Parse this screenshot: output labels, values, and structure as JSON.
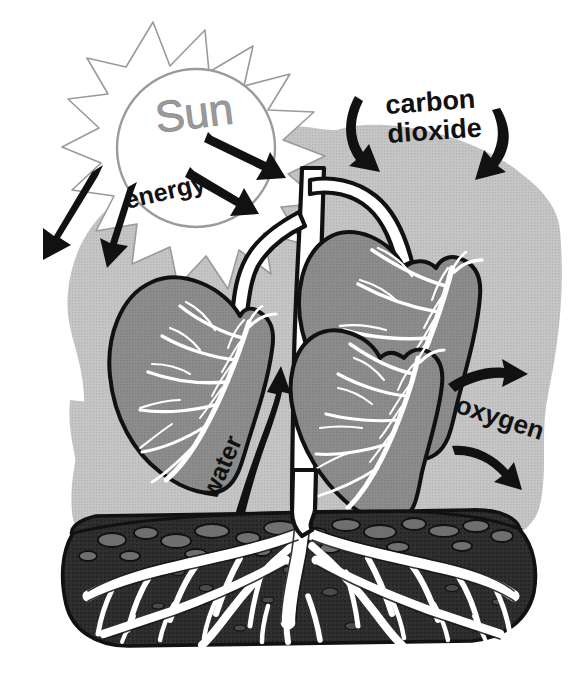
{
  "diagram": {
    "labels": {
      "sun": "Sun",
      "energy": "energy",
      "carbon_dioxide_line1": "carbon",
      "carbon_dioxide_line2": "dioxide",
      "oxygen": "oxygen",
      "water": "water"
    },
    "colors": {
      "background": "#ffffff",
      "halo": "#c2c2c2",
      "leaf_fill": "#8a8a8a",
      "leaf_outline": "#111111",
      "leaf_vein": "#ffffff",
      "stem_fill": "#ffffff",
      "stem_outline": "#111111",
      "soil_fill": "#2b2b2b",
      "soil_outline": "#111111",
      "pebble_fill": "#6f6f6f",
      "root_fill": "#ffffff",
      "arrow_black": "#111111",
      "sun_outline": "#9a9a9a",
      "sun_text": "#9a9a9a"
    },
    "elements": {
      "sun": "sun-with-rays",
      "leaves": 3,
      "energy_arrows": 4,
      "carbon_dioxide_arrows": 2,
      "oxygen_arrows": 2,
      "water_arrows": 1,
      "soil_mound": 1,
      "roots": "branching-root-system"
    }
  }
}
